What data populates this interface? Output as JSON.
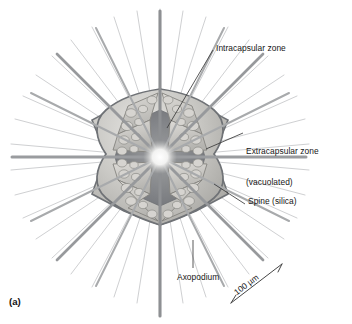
{
  "figure": {
    "panel_letter": "(a)",
    "style": "grayscale-pencil-illustration",
    "background_color": "#ffffff",
    "ink_color": "#161616"
  },
  "labels": {
    "intracapsular": "Intracapsular zone",
    "extracapsular_line1": "Extracapsular zone",
    "extracapsular_line2": "(vacuolated)",
    "spine": "Spine (silica)",
    "axopodium": "Axopodium"
  },
  "scale_bar": {
    "text": "100 µm",
    "orientation": "diagonal-up-right"
  },
  "organism": {
    "center_x": 160,
    "center_y": 157,
    "sectors": 8,
    "body_radius": 68,
    "major_spine_count": 8,
    "axopodia_count": 40,
    "colors": {
      "capsule_outline": "#6f7276",
      "capsule_fill_light": "#d8d7d4",
      "capsule_fill_mid": "#b9b8b4",
      "intracapsular_dark": "#7e8084",
      "vacuole_fill": "#cfcdc8",
      "vacuole_outline": "#8d8c88",
      "spine_dark": "#74767a",
      "spine_light": "#c9cacc",
      "axopodium": "#cdced0"
    }
  }
}
